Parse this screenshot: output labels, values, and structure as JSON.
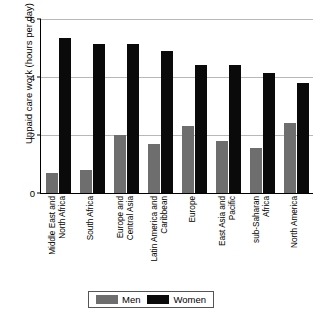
{
  "chart_data": {
    "type": "bar",
    "title": "",
    "xlabel": "",
    "ylabel": "Unpaid care work (hours per day)",
    "ylim": [
      0,
      6
    ],
    "yticks": [
      0,
      2,
      4,
      6
    ],
    "ytick_labels": [
      "0",
      "2",
      "4",
      "6"
    ],
    "grid": "horizontal",
    "legend_position": "bottom-center",
    "categories": [
      "Middle East and North Africa",
      "South Africa",
      "Europe and Central Asia",
      "Latin America and Caribbean",
      "Europe",
      "East Asia and Pacific",
      "sub-Saharan Africa",
      "North America"
    ],
    "category_lines": [
      [
        "Middle East and",
        "North Africa"
      ],
      [
        "South Africa"
      ],
      [
        "Europe and",
        "Central Asia"
      ],
      [
        "Latin America and",
        "Caribbean"
      ],
      [
        "Europe"
      ],
      [
        "East Asia and",
        "Pacific"
      ],
      [
        "sub-Saharan",
        "Africa"
      ],
      [
        "North America"
      ]
    ],
    "series": [
      {
        "name": "Men",
        "color": "#6e6e6e",
        "values": [
          0.7,
          0.8,
          2.0,
          1.7,
          2.3,
          1.8,
          1.55,
          2.4
        ]
      },
      {
        "name": "Women",
        "color": "#0a0a0a",
        "values": [
          5.35,
          5.15,
          5.15,
          4.9,
          4.4,
          4.4,
          4.15,
          3.8
        ]
      }
    ]
  },
  "legend": {
    "items": [
      {
        "label": "Men"
      },
      {
        "label": "Women"
      }
    ]
  }
}
